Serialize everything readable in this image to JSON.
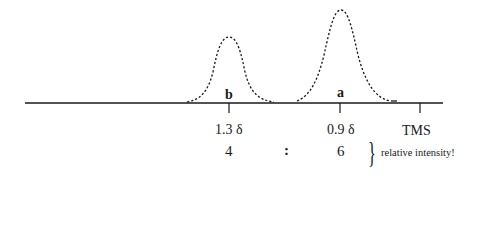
{
  "diagram": {
    "type": "nmr-spectrum-sketch",
    "baseline": {
      "x1": 25,
      "x2": 443,
      "y": 103
    },
    "peaks": [
      {
        "label": "b",
        "shift_label": "1.3 δ",
        "shift_ppm": 1.3,
        "integration": "4",
        "tick_x": 229,
        "apex_y": 37,
        "start_x": 187,
        "end_x": 274
      },
      {
        "label": "a",
        "shift_label": "0.9 δ",
        "shift_ppm": 0.9,
        "integration": "6",
        "tick_x": 340,
        "apex_y": 10,
        "start_x": 297,
        "end_x": 395
      }
    ],
    "reference": {
      "label": "TMS",
      "tick_x": 420
    },
    "ratio_separator": ":",
    "bracket_note": "relative intensity!",
    "colors": {
      "ink": "#1a1a1a",
      "background": "#ffffff"
    }
  }
}
